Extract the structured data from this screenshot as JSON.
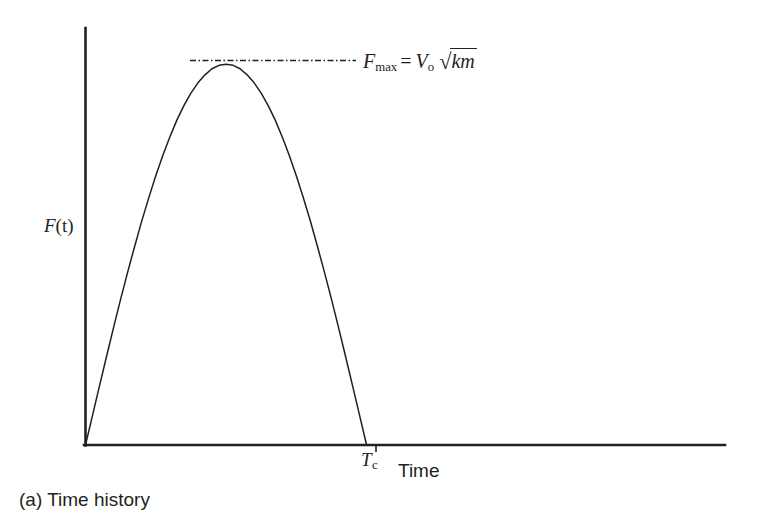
{
  "figure": {
    "caption": "(a) Time history",
    "background_color": "#ffffff",
    "ink_color": "#231f20"
  },
  "axes": {
    "y_label": "F(t)",
    "y_label_variable": "F",
    "y_label_argument": "(t)",
    "x_label": "Time",
    "x_tick_label": "T",
    "x_tick_subscript": "c"
  },
  "annotation": {
    "quantity": "F",
    "quantity_subscript": "max",
    "equals": "=",
    "velocity": "V",
    "velocity_subscript": "o",
    "radical_sign": "√",
    "radicand": "km",
    "full_text": "F_max = V_o √km",
    "guide_line_style": "dash-dot"
  },
  "chart_data": {
    "type": "line",
    "title": "(a) Time history",
    "xlabel": "Time",
    "ylabel": "F(t)",
    "xlim": [
      0,
      4.55
    ],
    "ylim": [
      0,
      1.095
    ],
    "grid": false,
    "legend": null,
    "series": [
      {
        "name": "Contact force half-sine pulse",
        "description": "F(t) = F_max * sin(pi * t / T_c) for 0 <= t <= T_c, zero afterwards",
        "x": [
          0.0,
          0.05,
          0.1,
          0.15,
          0.2,
          0.25,
          0.3,
          0.35,
          0.4,
          0.45,
          0.5,
          0.55,
          0.6,
          0.65,
          0.7,
          0.75,
          0.8,
          0.85,
          0.9,
          0.95,
          1.0,
          1.05,
          1.1,
          1.15,
          1.2,
          1.25,
          1.3,
          1.35,
          1.4,
          1.45,
          1.5,
          1.55,
          1.6,
          1.65,
          1.7,
          1.75,
          1.8,
          1.85,
          1.9,
          1.95,
          2.0
        ],
        "y": [
          0.0,
          0.078,
          0.156,
          0.233,
          0.309,
          0.383,
          0.454,
          0.522,
          0.588,
          0.649,
          0.707,
          0.76,
          0.809,
          0.853,
          0.891,
          0.924,
          0.951,
          0.972,
          0.988,
          0.997,
          1.0,
          0.997,
          0.988,
          0.972,
          0.951,
          0.924,
          0.891,
          0.853,
          0.809,
          0.76,
          0.707,
          0.649,
          0.588,
          0.522,
          0.454,
          0.383,
          0.309,
          0.233,
          0.156,
          0.078,
          0.0
        ]
      }
    ],
    "annotations": [
      {
        "name": "peak-guide-line",
        "type": "horizontal-dash-dot",
        "y": 1.0,
        "x_start": 0.75,
        "x_end": 1.92,
        "label": "F_max = V_o √km"
      },
      {
        "name": "contact-duration-tick",
        "type": "x-tick",
        "x": 2.0,
        "label": "T_c"
      }
    ],
    "peak": {
      "x": 1.0,
      "y": 1.0,
      "label": "F_max"
    },
    "zero_crossings": [
      0.0,
      2.0
    ]
  }
}
